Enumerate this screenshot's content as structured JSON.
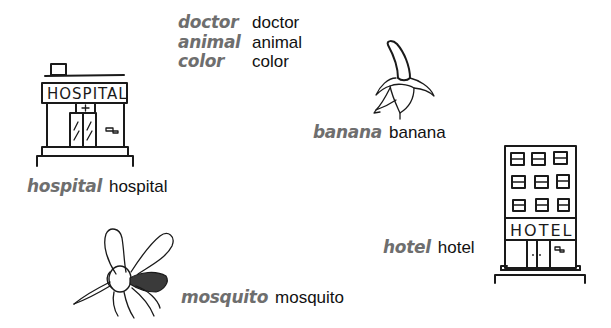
{
  "vocab_list": [
    {
      "term": "doctor",
      "translation": "doctor"
    },
    {
      "term": "animal",
      "translation": "animal"
    },
    {
      "term": "color",
      "translation": "color"
    }
  ],
  "illustrated_words": {
    "hospital": {
      "term": "hospital",
      "translation": "hospital",
      "sign_text": "HOSPITAL",
      "icon": "hospital-building-icon"
    },
    "banana": {
      "term": "banana",
      "translation": "banana",
      "icon": "peeled-banana-icon"
    },
    "hotel": {
      "term": "hotel",
      "translation": "hotel",
      "sign_text": "HOTEL",
      "icon": "hotel-building-icon"
    },
    "mosquito": {
      "term": "mosquito",
      "translation": "mosquito",
      "icon": "mosquito-icon"
    }
  },
  "colors": {
    "term": "#6e6e6e",
    "translation": "#111111",
    "ink": "#1a1a1a"
  }
}
